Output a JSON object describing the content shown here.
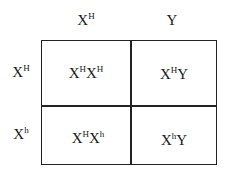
{
  "punnett_square": {
    "columns": [
      {
        "base": "X",
        "sup": "H"
      },
      {
        "base": "Y",
        "sup": ""
      }
    ],
    "rows": [
      {
        "base": "X",
        "sup": "H"
      },
      {
        "base": "X",
        "sup": "h"
      }
    ],
    "cells": [
      [
        {
          "p1": "X",
          "s1": "H",
          "p2": "X",
          "s2": "H"
        },
        {
          "p1": "X",
          "s1": "H",
          "p2": "Y",
          "s2": ""
        }
      ],
      [
        {
          "p1": "X",
          "s1": "H",
          "p2": "X",
          "s2": "h"
        },
        {
          "p1": "X",
          "s1": "h",
          "p2": "Y",
          "s2": ""
        }
      ]
    ]
  }
}
